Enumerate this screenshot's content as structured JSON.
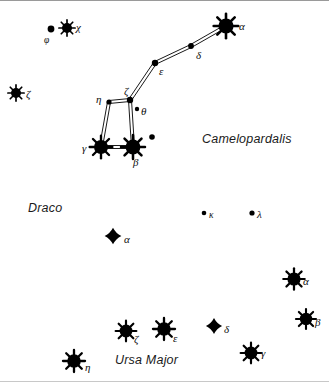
{
  "chart": {
    "width": 329,
    "height": 382,
    "background_color": "#ffffff",
    "star_color": "#000000",
    "line_color": "#000000"
  },
  "constellation_labels": [
    {
      "name": "Camelopardalis",
      "x": 202,
      "y": 131
    },
    {
      "name": "Draco",
      "x": 28,
      "y": 200
    },
    {
      "name": "Ursa Major",
      "x": 115,
      "y": 352
    }
  ],
  "stars": [
    {
      "id": "cam-phi",
      "label": "φ",
      "constellation": "Camelopardalis",
      "x": 51,
      "y": 28,
      "radius": 3.4,
      "type": "dot",
      "label_x": 44,
      "label_y": 34,
      "label_size": "small"
    },
    {
      "id": "cam-chi",
      "label": "χ",
      "constellation": "Camelopardalis",
      "x": 67,
      "y": 27,
      "radius": 5.0,
      "type": "starburst",
      "label_x": 76,
      "label_y": 20,
      "label_size": "normal"
    },
    {
      "id": "cam-zeta-w",
      "label": "ζ",
      "constellation": "Camelopardalis",
      "x": 16,
      "y": 92,
      "radius": 5.0,
      "type": "starburst",
      "label_x": 26,
      "label_y": 87,
      "label_size": "normal"
    },
    {
      "id": "cam-alpha",
      "label": "α",
      "constellation": "Camelopardalis",
      "x": 226,
      "y": 25,
      "radius": 7.6,
      "type": "starburst",
      "label_x": 239,
      "label_y": 19,
      "label_size": "normal"
    },
    {
      "id": "cam-delta",
      "label": "δ",
      "constellation": "Camelopardalis",
      "x": 191,
      "y": 45,
      "radius": 2.9,
      "type": "dot",
      "label_x": 196,
      "label_y": 48,
      "label_size": "normal"
    },
    {
      "id": "cam-eps",
      "label": "ε",
      "constellation": "Camelopardalis",
      "x": 155,
      "y": 62,
      "radius": 3.2,
      "type": "dot",
      "label_x": 159,
      "label_y": 64,
      "label_size": "normal"
    },
    {
      "id": "cam-zeta",
      "label": "ζ",
      "constellation": "Camelopardalis",
      "x": 130,
      "y": 99,
      "radius": 3.2,
      "type": "dot",
      "label_x": 124,
      "label_y": 84,
      "label_size": "normal"
    },
    {
      "id": "cam-eta",
      "label": "η",
      "constellation": "Camelopardalis",
      "x": 109,
      "y": 101,
      "radius": 2.6,
      "type": "dot",
      "label_x": 96,
      "label_y": 92,
      "label_size": "normal"
    },
    {
      "id": "cam-theta",
      "label": "θ",
      "constellation": "Camelopardalis",
      "x": 137,
      "y": 108,
      "radius": 2.2,
      "type": "dot",
      "label_x": 141,
      "label_y": 104,
      "label_size": "normal"
    },
    {
      "id": "cam-gamma",
      "label": "γ",
      "constellation": "Camelopardalis",
      "x": 101,
      "y": 146,
      "radius": 7.0,
      "type": "starburst",
      "label_x": 82,
      "label_y": 141,
      "label_size": "normal"
    },
    {
      "id": "cam-beta",
      "label": "β",
      "constellation": "Camelopardalis",
      "x": 133,
      "y": 146,
      "radius": 7.4,
      "type": "starburst",
      "label_x": 133,
      "label_y": 155,
      "label_size": "normal"
    },
    {
      "id": "cam-unl",
      "label": "",
      "constellation": "Camelopardalis",
      "x": 152,
      "y": 136,
      "radius": 2.8,
      "type": "dot",
      "label_x": 0,
      "label_y": 0,
      "label_size": "normal"
    },
    {
      "id": "uma-kappa",
      "label": "κ",
      "constellation": "Ursa Major",
      "x": 204,
      "y": 212,
      "radius": 2.3,
      "type": "dot",
      "label_x": 209,
      "label_y": 209,
      "label_size": "small"
    },
    {
      "id": "uma-lambda",
      "label": "λ",
      "constellation": "Ursa Major",
      "x": 252,
      "y": 212,
      "radius": 2.6,
      "type": "dot",
      "label_x": 257,
      "label_y": 207,
      "label_size": "normal"
    },
    {
      "id": "dra-alpha",
      "label": "α",
      "constellation": "Draco",
      "x": 113,
      "y": 235,
      "radius": 5.4,
      "type": "diamond",
      "label_x": 124,
      "label_y": 232,
      "label_size": "normal"
    },
    {
      "id": "uma-alpha",
      "label": "α",
      "constellation": "Ursa Major",
      "x": 294,
      "y": 278,
      "radius": 6.6,
      "type": "starburst",
      "label_x": 303,
      "label_y": 274,
      "label_size": "normal"
    },
    {
      "id": "uma-beta",
      "label": "β",
      "constellation": "Ursa Major",
      "x": 306,
      "y": 318,
      "radius": 6.2,
      "type": "starburst",
      "label_x": 315,
      "label_y": 315,
      "label_size": "normal"
    },
    {
      "id": "uma-zeta",
      "label": "ζ",
      "constellation": "Ursa Major",
      "x": 126,
      "y": 330,
      "radius": 6.4,
      "type": "starburst",
      "label_x": 134,
      "label_y": 332,
      "label_size": "normal"
    },
    {
      "id": "uma-eps",
      "label": "ε",
      "constellation": "Ursa Major",
      "x": 164,
      "y": 328,
      "radius": 6.8,
      "type": "starburst",
      "label_x": 173,
      "label_y": 331,
      "label_size": "normal"
    },
    {
      "id": "uma-delta",
      "label": "δ",
      "constellation": "Ursa Major",
      "x": 214,
      "y": 325,
      "radius": 5.2,
      "type": "diamond",
      "label_x": 224,
      "label_y": 322,
      "label_size": "normal"
    },
    {
      "id": "uma-gamma",
      "label": "γ",
      "constellation": "Ursa Major",
      "x": 251,
      "y": 352,
      "radius": 6.4,
      "type": "starburst",
      "label_x": 261,
      "label_y": 346,
      "label_size": "normal"
    },
    {
      "id": "uma-eta",
      "label": "η",
      "constellation": "Ursa Major",
      "x": 74,
      "y": 360,
      "radius": 6.8,
      "type": "starburst",
      "label_x": 85,
      "label_y": 360,
      "label_size": "normal"
    }
  ],
  "constellation_lines": [
    {
      "from": "cam-alpha",
      "to": "cam-delta"
    },
    {
      "from": "cam-delta",
      "to": "cam-eps"
    },
    {
      "from": "cam-eps",
      "to": "cam-zeta"
    },
    {
      "from": "cam-zeta",
      "to": "cam-eta"
    },
    {
      "from": "cam-zeta",
      "to": "cam-beta"
    },
    {
      "from": "cam-eta",
      "to": "cam-gamma"
    },
    {
      "from": "cam-gamma",
      "to": "cam-beta"
    }
  ]
}
